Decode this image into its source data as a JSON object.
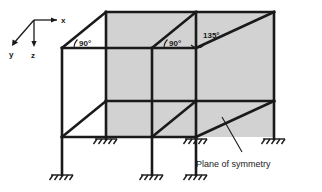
{
  "figure": {
    "colors": {
      "panel_fill": "#d2d2d2",
      "line": "#1a1a1a",
      "background": "#ffffff"
    }
  },
  "axes": {
    "x_label": "x",
    "y_label": "y",
    "z_label": "z"
  },
  "angles": [
    {
      "value": "90°",
      "location": "left-bay-roof-joint"
    },
    {
      "value": "90°",
      "location": "middle-bay-roof-joint"
    },
    {
      "value": "135°",
      "location": "right-bay-roof-joint"
    }
  ],
  "annotations": {
    "plane_of_symmetry": "Plane of symmetry"
  },
  "supports": {
    "type": "fixed-support",
    "count": 7
  }
}
